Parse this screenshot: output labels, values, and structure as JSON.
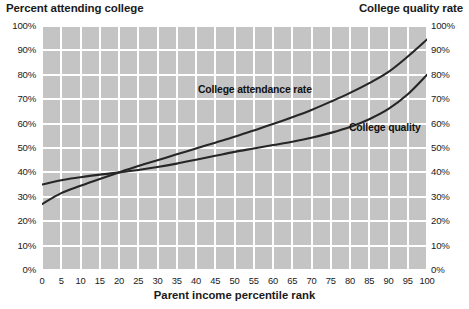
{
  "header": {
    "left_axis_title": "Percent attending college",
    "right_axis_title": "College quality rate"
  },
  "chart_data": {
    "type": "line",
    "title": "Percent attending college",
    "xlabel": "Parent income percentile rank",
    "ylabel": "Percent attending college",
    "y2label": "College quality rate",
    "xlim": [
      0,
      100
    ],
    "ylim": [
      0,
      100
    ],
    "y2lim": [
      0,
      100
    ],
    "grid": true,
    "legend": "inline-annotations",
    "xticks": [
      0,
      5,
      10,
      15,
      20,
      25,
      30,
      35,
      40,
      45,
      50,
      55,
      60,
      65,
      70,
      75,
      80,
      85,
      90,
      95,
      100
    ],
    "xtick_labels": [
      "0",
      "5",
      "10",
      "15",
      "20",
      "25",
      "30",
      "35",
      "40",
      "45",
      "50",
      "55",
      "60",
      "65",
      "70",
      "75",
      "80",
      "85",
      "90",
      "95",
      "100"
    ],
    "yticks": [
      0,
      10,
      20,
      30,
      40,
      50,
      60,
      70,
      80,
      90,
      100
    ],
    "ytick_labels": [
      "0%",
      "10%",
      "20%",
      "30%",
      "40%",
      "50%",
      "60%",
      "70%",
      "80%",
      "90%",
      "100%"
    ],
    "y2ticks": [
      0,
      10,
      20,
      30,
      40,
      50,
      60,
      70,
      80,
      90,
      100
    ],
    "y2tick_labels": [
      "0%",
      "10%",
      "20%",
      "30%",
      "40%",
      "50%",
      "60%",
      "70%",
      "80%",
      "90%",
      "100%"
    ],
    "x": [
      0,
      5,
      10,
      15,
      20,
      25,
      30,
      35,
      40,
      45,
      50,
      55,
      60,
      65,
      70,
      75,
      80,
      85,
      90,
      95,
      100
    ],
    "series": [
      {
        "name": "College attendance rate",
        "axis": "left",
        "color": "#262626",
        "values": [
          27.0,
          31.5,
          34.5,
          37.3,
          40.0,
          42.6,
          45.0,
          47.4,
          49.8,
          52.2,
          54.6,
          57.2,
          59.8,
          62.6,
          65.6,
          69.0,
          72.6,
          76.6,
          81.2,
          87.5,
          94.5
        ]
      },
      {
        "name": "College quality",
        "axis": "right",
        "color": "#262626",
        "values": [
          35.0,
          36.8,
          38.0,
          39.1,
          40.0,
          41.0,
          42.2,
          43.6,
          45.2,
          46.8,
          48.4,
          49.8,
          51.2,
          52.6,
          54.2,
          56.2,
          58.6,
          61.8,
          66.0,
          72.0,
          80.0
        ]
      }
    ],
    "annotations": [
      {
        "text": "College attendance rate",
        "x": 41,
        "y": 76
      },
      {
        "text": "College quality",
        "x": 80,
        "y": 58
      }
    ],
    "background_color": "#c4c4c4",
    "gridline_color": "#ffffff"
  }
}
